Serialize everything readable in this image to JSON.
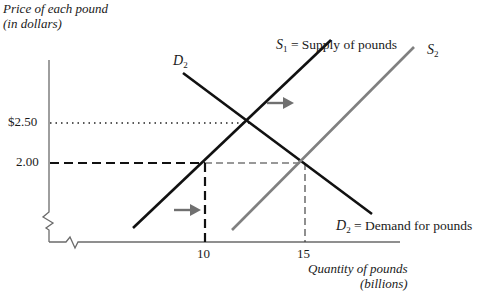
{
  "diagram": {
    "type": "supply-demand",
    "y_axis": {
      "label_line1": "Price of each pound",
      "label_line2": "(in dollars)",
      "ticks": [
        {
          "label": "$2.50",
          "value": 2.5,
          "line_style": "dotted"
        },
        {
          "label": "2.00",
          "value": 2.0,
          "line_style": "dashed"
        }
      ]
    },
    "x_axis": {
      "label_line1": "Quantity of pounds",
      "label_line2": "(billions)",
      "ticks": [
        {
          "label": "10",
          "value": 10
        },
        {
          "label": "15",
          "value": 15
        }
      ]
    },
    "curves": [
      {
        "id": "S1",
        "symbol": "S",
        "sub": "1",
        "text": " = Supply of pounds",
        "color": "#111111"
      },
      {
        "id": "S2",
        "symbol": "S",
        "sub": "2",
        "text": "",
        "color": "#808080"
      },
      {
        "id": "D2_top",
        "symbol": "D",
        "sub": "2",
        "text": "",
        "color": "#111111"
      },
      {
        "id": "D2",
        "symbol": "D",
        "sub": "2",
        "text": " = Demand for pounds",
        "color": "#111111"
      }
    ],
    "equilibria": [
      {
        "price": 2.5,
        "quantity": 12.5,
        "curves": [
          "S1",
          "D2"
        ]
      },
      {
        "price": 2.0,
        "quantity": 15,
        "curves": [
          "S2",
          "D2"
        ]
      }
    ],
    "arrows": [
      {
        "direction": "right",
        "meaning": "supply shift from S1 to S2",
        "color": "#707070"
      },
      {
        "direction": "right",
        "meaning": "quantity shift",
        "color": "#707070"
      }
    ]
  }
}
